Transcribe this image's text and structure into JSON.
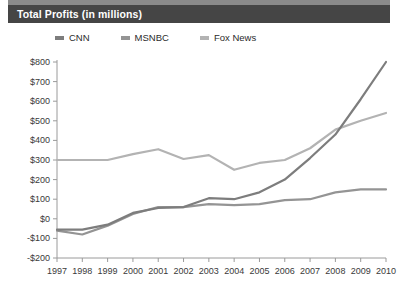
{
  "card": {
    "title": "Total Profits (in millions)",
    "title_bar_color": "#454545",
    "title_text_color": "#ffffff"
  },
  "legend": {
    "position": "top",
    "items": [
      {
        "label": "CNN",
        "color": "#7d7d7d",
        "swatch": "legend-swatch-cnn"
      },
      {
        "label": "MSNBC",
        "color": "#949494",
        "swatch": "legend-swatch-msnbc"
      },
      {
        "label": "Fox News",
        "color": "#b3b3b3",
        "swatch": "legend-swatch-foxnews"
      }
    ]
  },
  "axes": {
    "y_ticks": [
      "$800",
      "$700",
      "$600",
      "$500",
      "$400",
      "$300",
      "$200",
      "$100",
      "$0",
      "-$100",
      "-$200"
    ],
    "x_ticks": [
      "1997",
      "1998",
      "1999",
      "2000",
      "2001",
      "2002",
      "2003",
      "2004",
      "2005",
      "2006",
      "2007",
      "2008",
      "2009",
      "2010"
    ],
    "axis_color": "#9a9a9a",
    "tick_text_color": "#3a3a3a"
  },
  "chart_data": {
    "type": "line",
    "title": "Total Profits (in millions)",
    "xlabel": "",
    "ylabel": "",
    "x": [
      1997,
      1998,
      1999,
      2000,
      2001,
      2002,
      2003,
      2004,
      2005,
      2006,
      2007,
      2008,
      2009,
      2010
    ],
    "categories": [
      "1997",
      "1998",
      "1999",
      "2000",
      "2001",
      "2002",
      "2003",
      "2004",
      "2005",
      "2006",
      "2007",
      "2008",
      "2009",
      "2010"
    ],
    "ylim": [
      -200,
      800
    ],
    "xlim": [
      1997,
      2010
    ],
    "ytick_step": 100,
    "grid": false,
    "legend_position": "top",
    "value_prefix": "$",
    "value_unit": "millions",
    "series": [
      {
        "name": "CNN",
        "color": "#7d7d7d",
        "values": [
          -55,
          -55,
          -30,
          30,
          55,
          60,
          105,
          100,
          135,
          200,
          310,
          430,
          610,
          800
        ]
      },
      {
        "name": "MSNBC",
        "color": "#949494",
        "values": [
          -60,
          -80,
          -35,
          25,
          60,
          60,
          75,
          70,
          75,
          95,
          100,
          135,
          150,
          150
        ]
      },
      {
        "name": "Fox News",
        "color": "#b3b3b3",
        "values": [
          300,
          300,
          300,
          330,
          355,
          305,
          325,
          250,
          285,
          300,
          360,
          455,
          500,
          540
        ]
      }
    ]
  }
}
